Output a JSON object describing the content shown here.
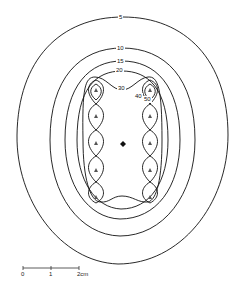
{
  "diagram": {
    "type": "contour-map",
    "contour_labels": [
      "5",
      "10",
      "15",
      "20",
      "30",
      "40",
      "50"
    ],
    "source_markers": 10,
    "center_marker": "plus-diamond",
    "scale_bar": {
      "ticks": [
        "0",
        "1",
        "2cm"
      ]
    }
  }
}
